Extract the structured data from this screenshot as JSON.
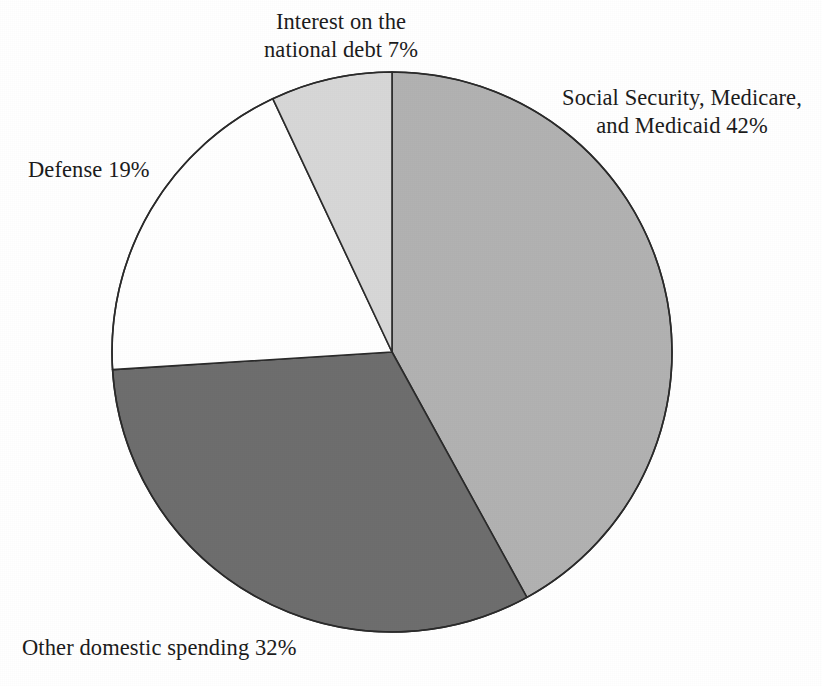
{
  "chart_data": {
    "type": "pie",
    "title": "",
    "subtitle": "",
    "xlabel": "",
    "ylabel": "",
    "legend_position": "none",
    "grid": false,
    "start_angle_deg": 0,
    "direction": "clockwise",
    "center": {
      "cx": 392,
      "cy": 352,
      "r": 280
    },
    "units": "percent",
    "total": 100,
    "categories": [
      "Social Security, Medicare, and Medicaid",
      "Other domestic spending",
      "Defense",
      "Interest on the national debt"
    ],
    "values": [
      42,
      32,
      19,
      7
    ],
    "slices": [
      {
        "name": "social-security-medicare-medicaid",
        "label_line1": "Social Security, Medicare,",
        "label_line2": "and Medicaid 42%",
        "value": 42,
        "value_text": "42%",
        "color": "#b2b2b2",
        "stroke": "#2b2b2b",
        "start_deg": 0,
        "end_deg": 151.2
      },
      {
        "name": "other-domestic-spending",
        "label_line1": "Other domestic spending 32%",
        "label_line2": "",
        "value": 32,
        "value_text": "32%",
        "color": "#6e6e6e",
        "stroke": "#2b2b2b",
        "start_deg": 151.2,
        "end_deg": 266.4
      },
      {
        "name": "defense",
        "label_line1": "Defense 19%",
        "label_line2": "",
        "value": 19,
        "value_text": "19%",
        "color": "#ffffff",
        "stroke": "#2b2b2b",
        "start_deg": 266.4,
        "end_deg": 334.8
      },
      {
        "name": "interest-on-the-national-debt",
        "label_line1": "Interest on the",
        "label_line2": "national debt 7%",
        "value": 7,
        "value_text": "7%",
        "color": "#d7d7d7",
        "stroke": "#2b2b2b",
        "start_deg": 334.8,
        "end_deg": 360
      }
    ]
  },
  "labels": {
    "interest": {
      "line1": "Interest on the",
      "line2": "national debt 7%"
    },
    "social": {
      "line1": "Social Security, Medicare,",
      "line2": "and Medicaid 42%"
    },
    "defense": {
      "line1": "Defense 19%"
    },
    "other": {
      "line1": "Other domestic spending 32%"
    }
  },
  "colors": {
    "background": "#ffffff",
    "outline": "#2b2b2b",
    "text": "#1c1c1c",
    "slice_social": "#b2b2b2",
    "slice_other": "#6e6e6e",
    "slice_defense": "#ffffff",
    "slice_interest": "#d7d7d7"
  }
}
